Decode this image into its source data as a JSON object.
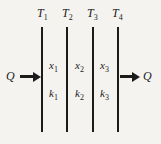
{
  "diagram": {
    "type": "composite-wall-heat-conduction",
    "temperatures": [
      {
        "base": "T",
        "sub": "1"
      },
      {
        "base": "T",
        "sub": "2"
      },
      {
        "base": "T",
        "sub": "3"
      },
      {
        "base": "T",
        "sub": "4"
      }
    ],
    "layers": [
      {
        "thickness_base": "x",
        "thickness_sub": "1",
        "conductivity_base": "k",
        "conductivity_sub": "1"
      },
      {
        "thickness_base": "x",
        "thickness_sub": "2",
        "conductivity_base": "k",
        "conductivity_sub": "2"
      },
      {
        "thickness_base": "x",
        "thickness_sub": "3",
        "conductivity_base": "k",
        "conductivity_sub": "3"
      }
    ],
    "heat_flow_in": {
      "label": "Q"
    },
    "heat_flow_out": {
      "label": "Q"
    },
    "colors": {
      "background": "#f4f3f0",
      "ink": "#1b1b1b"
    }
  }
}
